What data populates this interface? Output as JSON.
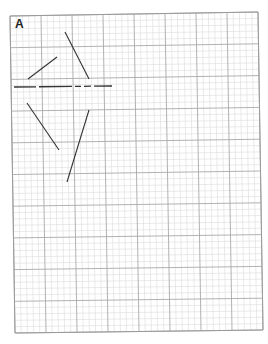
{
  "figure": {
    "panel_label": "A",
    "paper": {
      "corners": {
        "top_left": [
          10,
          16
        ],
        "top_right": [
          258,
          12
        ],
        "bottom_right": [
          263,
          330
        ],
        "bottom_left": [
          15,
          333
        ]
      },
      "major_divisions_x": 8,
      "major_divisions_y": 10,
      "minor_per_major": 5,
      "colors": {
        "background": "#ffffff",
        "major_line": "#a9a9a9",
        "minor_line": "#dcdcdc",
        "border": "#9a9a9a",
        "ink": "#333333"
      }
    },
    "dashed_line": {
      "from": [
        14,
        87
      ],
      "to": [
        112,
        86
      ],
      "segments": [
        [
          14,
          36
        ],
        [
          39,
          72
        ],
        [
          75,
          81
        ],
        [
          84,
          91
        ],
        [
          94,
          112
        ]
      ]
    },
    "line_segments": [
      {
        "id": "upper-left",
        "from": [
          28,
          79
        ],
        "to": [
          57,
          57
        ]
      },
      {
        "id": "upper-right",
        "from": [
          65,
          32
        ],
        "to": [
          89,
          79
        ]
      },
      {
        "id": "lower-left",
        "from": [
          27,
          103
        ],
        "to": [
          59,
          150
        ]
      },
      {
        "id": "lower-right",
        "from": [
          89,
          110
        ],
        "to": [
          67,
          182
        ]
      }
    ]
  }
}
